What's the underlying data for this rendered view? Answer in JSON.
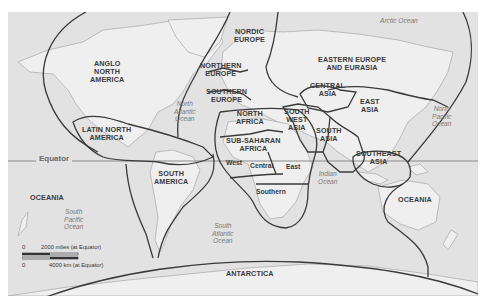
{
  "map": {
    "background_color": "#e2e2e2",
    "land_color": "#efefef",
    "boundary_color": "#3a3a3a",
    "regions": [
      {
        "id": "anglo",
        "label": "ANGLO\nNORTH\nAMERICA",
        "lines": [
          "ANGLO",
          "NORTH",
          "AMERICA"
        ]
      },
      {
        "id": "latin",
        "lines": [
          "LATIN NORTH",
          "AMERICA"
        ]
      },
      {
        "id": "south-america",
        "lines": [
          "SOUTH",
          "AMERICA"
        ]
      },
      {
        "id": "nordic",
        "lines": [
          "NORDIC",
          "EUROPE"
        ]
      },
      {
        "id": "northern-europe",
        "lines": [
          "NORTHERN",
          "EUROPE"
        ]
      },
      {
        "id": "southern-europe",
        "lines": [
          "SOUTHERN",
          "EUROPE"
        ]
      },
      {
        "id": "north-africa",
        "lines": [
          "NORTH",
          "AFRICA"
        ]
      },
      {
        "id": "sub-saharan",
        "lines": [
          "SUB-SAHARAN",
          "AFRICA"
        ]
      },
      {
        "id": "eastern-europe",
        "lines": [
          "EASTERN EUROPE",
          "AND EURASIA"
        ]
      },
      {
        "id": "central-asia",
        "lines": [
          "CENTRAL",
          "ASIA"
        ]
      },
      {
        "id": "southwest-asia",
        "lines": [
          "SOUTH",
          "WEST",
          "ASIA"
        ]
      },
      {
        "id": "south-asia",
        "lines": [
          "SOUTH",
          "ASIA"
        ]
      },
      {
        "id": "east-asia",
        "lines": [
          "EAST",
          "ASIA"
        ]
      },
      {
        "id": "southeast-asia",
        "lines": [
          "SOUTHEAST",
          "ASIA"
        ]
      },
      {
        "id": "oceania-east",
        "lines": [
          "OCEANIA"
        ]
      },
      {
        "id": "oceania-west",
        "lines": [
          "OCEANIA"
        ]
      },
      {
        "id": "antarctica",
        "lines": [
          "ANTARCTICA"
        ]
      }
    ],
    "subregions": {
      "west": "West",
      "central": "Central",
      "east": "East",
      "southern": "Southern"
    },
    "oceans": [
      {
        "id": "arctic",
        "lines": [
          "Arctic Ocean"
        ]
      },
      {
        "id": "north-atlantic",
        "lines": [
          "North",
          "Atlantic",
          "Ocean"
        ]
      },
      {
        "id": "north-pacific",
        "lines": [
          "North",
          "Pacific",
          "Ocean"
        ]
      },
      {
        "id": "indian",
        "lines": [
          "Indian",
          "Ocean"
        ]
      },
      {
        "id": "south-pacific",
        "lines": [
          "South",
          "Pacific",
          "Ocean"
        ]
      },
      {
        "id": "south-atlantic",
        "lines": [
          "South",
          "Atlantic",
          "Ocean"
        ]
      }
    ],
    "equator_label": "Equator",
    "scale": {
      "zero_top": "0",
      "miles": "2000 miles (at Equator)",
      "zero_bottom": "0",
      "km": "4000 km (at Equator)"
    }
  }
}
